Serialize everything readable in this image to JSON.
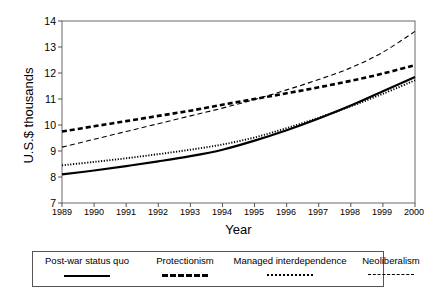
{
  "chart_data": {
    "type": "line",
    "title": "",
    "xlabel": "Year",
    "ylabel": "U.S.$ thousands",
    "xlim": [
      1989,
      2000
    ],
    "ylim": [
      7,
      14
    ],
    "xticks": [
      1989,
      1990,
      1991,
      1992,
      1993,
      1994,
      1995,
      1996,
      1997,
      1998,
      1999,
      2000
    ],
    "yticks": [
      7,
      8,
      9,
      10,
      11,
      12,
      13,
      14
    ],
    "grid": false,
    "legend_position": "below",
    "x": [
      1989,
      1990,
      1991,
      1992,
      1993,
      1994,
      1995,
      1996,
      1997,
      1998,
      1999,
      2000
    ],
    "series": [
      {
        "name": "Post-war status quo",
        "style": "solid",
        "values": [
          8.1,
          8.25,
          8.42,
          8.6,
          8.8,
          9.05,
          9.4,
          9.8,
          10.25,
          10.75,
          11.3,
          11.85
        ]
      },
      {
        "name": "Protectionism",
        "style": "bold-dashed",
        "values": [
          9.75,
          9.95,
          10.15,
          10.35,
          10.55,
          10.78,
          11.0,
          11.22,
          11.45,
          11.7,
          11.98,
          12.3
        ]
      },
      {
        "name": "Managed interdependence",
        "style": "dotted",
        "values": [
          8.45,
          8.58,
          8.72,
          8.88,
          9.05,
          9.25,
          9.52,
          9.88,
          10.28,
          10.72,
          11.2,
          11.72
        ]
      },
      {
        "name": "Neoliberalism",
        "style": "thin-dashed",
        "values": [
          9.15,
          9.45,
          9.75,
          10.05,
          10.35,
          10.65,
          10.98,
          11.35,
          11.75,
          12.2,
          12.8,
          13.6
        ]
      }
    ]
  },
  "axes": {
    "ytick_labels": [
      "14",
      "13",
      "12",
      "11",
      "10",
      "9",
      "8",
      "7"
    ],
    "xtick_labels": [
      "1989",
      "1990",
      "1991",
      "1992",
      "1993",
      "1994",
      "1995",
      "1996",
      "1997",
      "1998",
      "1999",
      "2000"
    ],
    "ylabel": "U.S.$ thousands",
    "xlabel": "Year"
  },
  "legend": {
    "entries": [
      {
        "label": "Post-war status quo"
      },
      {
        "label": "Protectionism"
      },
      {
        "label": "Managed interdependence"
      },
      {
        "label": "Neoliberalism"
      }
    ]
  },
  "colors": {
    "line": "#000000",
    "axis": "#555555",
    "background": "#ffffff"
  }
}
